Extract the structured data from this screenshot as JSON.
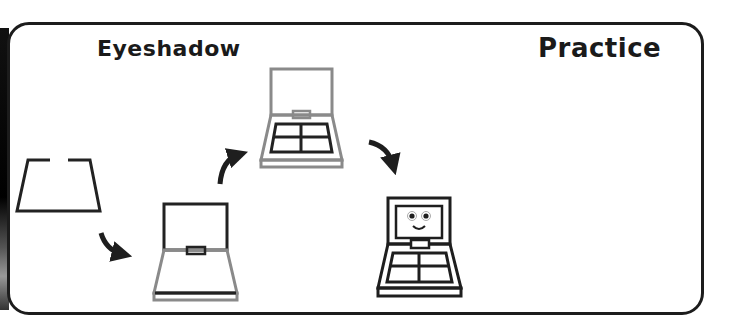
{
  "header": {
    "left_title": "Eyeshadow",
    "right_title": "Practice"
  },
  "colors": {
    "frame_stroke": "#1c1c1c",
    "line_black": "#1e1e1e",
    "line_gray": "#8a8a8a",
    "background": "#ffffff"
  },
  "steps": [
    {
      "index": 1,
      "name": "step-1-base-outline",
      "description": "open trapezoid outline (black)"
    },
    {
      "index": 2,
      "name": "step-2-lid-and-base",
      "description": "lid drawn in black, base in gray"
    },
    {
      "index": 3,
      "name": "step-3-pan-grid",
      "description": "four-pan grid drawn in black, rest gray"
    },
    {
      "index": 4,
      "name": "step-4-finished-face",
      "description": "finished palette with smiling face (all black)"
    }
  ],
  "arrows": [
    {
      "from": 1,
      "to": 2,
      "icon": "curved-arrow-down-right"
    },
    {
      "from": 2,
      "to": 3,
      "icon": "curved-arrow-up-right"
    },
    {
      "from": 3,
      "to": 4,
      "icon": "curved-arrow-down-right"
    }
  ]
}
